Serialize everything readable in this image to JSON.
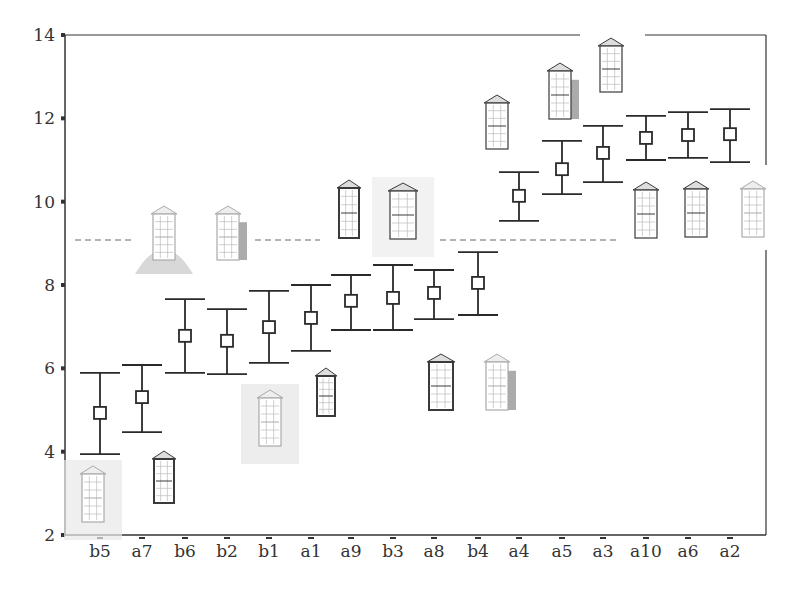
{
  "chart_data": {
    "type": "scatter",
    "subtype": "error-bar",
    "title": "",
    "xlabel": "",
    "ylabel": "",
    "ylim": [
      2,
      14
    ],
    "yticks": [
      2,
      4,
      6,
      8,
      10,
      12,
      14
    ],
    "grid": false,
    "legend": null,
    "categories": [
      "b5",
      "a7",
      "b6",
      "b2",
      "b1",
      "a1",
      "a9",
      "b3",
      "a8",
      "b4",
      "a4",
      "a5",
      "a3",
      "a10",
      "a6",
      "a2"
    ],
    "series": [
      {
        "name": "mean",
        "marker": "open-square",
        "values": [
          4.93,
          5.31,
          6.78,
          6.66,
          6.99,
          7.21,
          7.62,
          7.69,
          7.81,
          8.05,
          10.14,
          10.78,
          11.17,
          11.53,
          11.6,
          11.62
        ]
      },
      {
        "name": "upper",
        "values": [
          5.89,
          6.08,
          7.66,
          7.42,
          7.86,
          8.0,
          8.24,
          8.48,
          8.36,
          8.79,
          10.71,
          11.46,
          11.82,
          12.06,
          12.15,
          12.22
        ]
      },
      {
        "name": "lower",
        "values": [
          3.94,
          4.47,
          5.89,
          5.86,
          6.13,
          6.42,
          6.92,
          6.92,
          7.18,
          7.28,
          9.54,
          10.18,
          10.47,
          11.0,
          11.05,
          10.95
        ]
      }
    ],
    "reference_line": {
      "y": 9.08,
      "style": "dashed"
    },
    "annotations": "Each category is illustrated by a small sketch of a window (thumbnail image) placed near its error bar"
  },
  "colors": {
    "axis": "#333333",
    "errorbar": "#2a2a2a",
    "dashed": "#666666"
  }
}
